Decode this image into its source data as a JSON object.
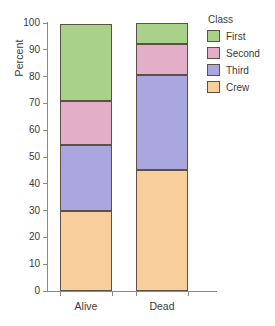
{
  "chart_data": {
    "type": "bar",
    "subtype": "stacked-100-percent",
    "title": "",
    "xlabel": "",
    "ylabel": "Percent",
    "ylim": [
      0,
      100
    ],
    "ytick_labels": [
      "0",
      "10",
      "20",
      "30",
      "40",
      "50",
      "60",
      "70",
      "80",
      "90",
      "100"
    ],
    "ytick_values": [
      0,
      10,
      20,
      30,
      40,
      50,
      60,
      70,
      80,
      90,
      100
    ],
    "grid": false,
    "legend_position": "right",
    "legend_title": "Class",
    "categories": [
      "Alive",
      "Dead"
    ],
    "series": [
      {
        "name": "First",
        "color": "#a9d18a",
        "values": [
          28.5,
          8.0
        ]
      },
      {
        "name": "Second",
        "color": "#e3aec8",
        "values": [
          16.5,
          11.5
        ]
      },
      {
        "name": "Third",
        "color": "#aaa6e0",
        "values": [
          24.5,
          35.5
        ]
      },
      {
        "name": "Crew",
        "color": "#f8cf9b",
        "values": [
          30.0,
          45.0
        ]
      }
    ],
    "stack_boundaries": {
      "Alive": {
        "Crew": [
          0,
          30.0
        ],
        "Third": [
          30.0,
          54.5
        ],
        "Second": [
          54.5,
          71.0
        ],
        "First": [
          71.0,
          100
        ]
      },
      "Dead": {
        "Crew": [
          0,
          45.0
        ],
        "Third": [
          45.0,
          80.5
        ],
        "Second": [
          80.5,
          92.0
        ],
        "First": [
          92.0,
          100
        ]
      }
    },
    "colors": {
      "first": "#a9d18a",
      "second": "#e3aec8",
      "third": "#aaa6e0",
      "crew": "#f8cf9b",
      "segment_border": "#5d5145",
      "axis": "#8a8a8a",
      "text": "#3a3a3a",
      "background": "#ffffff"
    }
  },
  "legend": {
    "title": "Class",
    "items": [
      {
        "label": "First",
        "color": "#a9d18a"
      },
      {
        "label": "Second",
        "color": "#e3aec8"
      },
      {
        "label": "Third",
        "color": "#aaa6e0"
      },
      {
        "label": "Crew",
        "color": "#f8cf9b"
      }
    ]
  },
  "axes": {
    "y_title": "Percent",
    "x_categories": [
      "Alive",
      "Dead"
    ]
  }
}
